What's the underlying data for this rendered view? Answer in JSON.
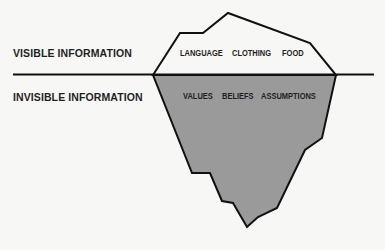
{
  "diagram": {
    "labels": {
      "visible": "VISIBLE INFORMATION",
      "invisible": "INVISIBLE INFORMATION"
    },
    "above_water": [
      "LANGUAGE",
      "CLOTHING",
      "FOOD"
    ],
    "below_water": [
      "VALUES",
      "BELIEFS",
      "ASSUMPTIONS"
    ],
    "colors": {
      "background": "#f7f7f5",
      "outline": "#111111",
      "above_fill": "#f7f7f5",
      "below_fill": "#9a9a9a"
    }
  }
}
